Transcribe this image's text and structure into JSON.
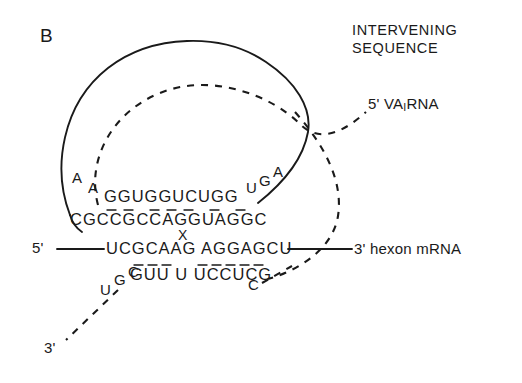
{
  "figure": {
    "panel_label": "B",
    "heading_line1": "INTERVENING",
    "heading_line2": "SEQUENCE",
    "ink_color": "#1a1a1a",
    "background": "#ffffff",
    "width": 522,
    "height": 383
  },
  "labels": {
    "va_rna": "5' VA",
    "va_rna_subscript": "I",
    "va_rna_tail": "RNA",
    "va_rna_full": "5' VA,RNA",
    "hexon_3prime": "3' hexon mRNA",
    "mrna_5prime": "5'",
    "va_3prime": "3'",
    "junction_mark": "X"
  },
  "sequences": {
    "va_loop_left_bases": [
      "A",
      "A"
    ],
    "va_top_strand": "GGUGGUCUGG",
    "va_top_arc_bases": [
      "U",
      "G",
      "A"
    ],
    "va_bottom_strand": "CGCCGCCAGGUAGGC",
    "mrna_strand": "UCGCAAG AGGAGCU",
    "va_pairing_strand": "GUU U UCCUCG",
    "va_tail_right_base": "C",
    "va_tail_left_bases": [
      "C",
      "G",
      "U"
    ]
  },
  "annotations": {
    "description": "RNA secondary structure: VA RNA base-paired across a hexon mRNA splice junction",
    "solid_curve": "VA RNA backbone (solid)",
    "dashed_curve": "intervening sequence / pre-mRNA path (dashed)"
  }
}
